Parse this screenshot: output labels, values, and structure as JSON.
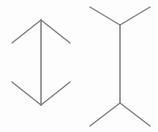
{
  "figure": {
    "type": "muller-lyer-illusion",
    "background_color": "#fdfdfd",
    "line_color": "#7d7d7d",
    "canvas": {
      "width": 158,
      "height": 132
    },
    "shapes": [
      {
        "id": "left-figure",
        "name": "arrowhead-inward-figure",
        "description": "Vertical shaft with inward pointing arrowheads at both ends",
        "shaft": {
          "x1": 41,
          "y1": 20,
          "x2": 41,
          "y2": 105
        },
        "fins": [
          {
            "name": "top-left-fin",
            "x1": 41,
            "y1": 20,
            "x2": 12,
            "y2": 43
          },
          {
            "name": "top-right-fin",
            "x1": 41,
            "y1": 20,
            "x2": 70,
            "y2": 43
          },
          {
            "name": "bottom-left-fin",
            "x1": 41,
            "y1": 105,
            "x2": 12,
            "y2": 82
          },
          {
            "name": "bottom-right-fin",
            "x1": 41,
            "y1": 105,
            "x2": 70,
            "y2": 82
          }
        ]
      },
      {
        "id": "right-figure",
        "name": "arrowhead-outward-figure",
        "description": "Vertical shaft with outward pointing fins at both ends",
        "shaft": {
          "x1": 120,
          "y1": 25,
          "x2": 120,
          "y2": 103
        },
        "fins": [
          {
            "name": "top-left-fin",
            "x1": 120,
            "y1": 25,
            "x2": 90,
            "y2": 7
          },
          {
            "name": "top-right-fin",
            "x1": 120,
            "y1": 25,
            "x2": 150,
            "y2": 7
          },
          {
            "name": "bottom-left-fin",
            "x1": 120,
            "y1": 103,
            "x2": 90,
            "y2": 126
          },
          {
            "name": "bottom-right-fin",
            "x1": 120,
            "y1": 103,
            "x2": 150,
            "y2": 126
          }
        ]
      }
    ],
    "labels": {
      "left_figure_label": "",
      "right_figure_label": ""
    }
  }
}
